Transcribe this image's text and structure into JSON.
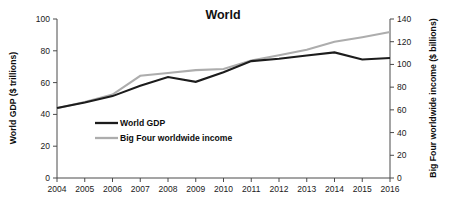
{
  "chart_data": {
    "type": "line",
    "title": "World",
    "xlabel": "",
    "ylabel": "World GDP ($ trillions)",
    "y2label": "Big Four worldwide income ($ billions)",
    "grid": false,
    "legend_position": "inside-left",
    "categories": [
      "2004",
      "2005",
      "2006",
      "2007",
      "2008",
      "2009",
      "2010",
      "2011",
      "2012",
      "2013",
      "2014",
      "2015",
      "2016"
    ],
    "x": [
      2004,
      2005,
      2006,
      2007,
      2008,
      2009,
      2010,
      2011,
      2012,
      2013,
      2014,
      2015,
      2016
    ],
    "ylim": [
      0,
      100
    ],
    "yticks": [
      0,
      20,
      40,
      60,
      80,
      100
    ],
    "ytick_labels": [
      "0",
      "20",
      "40",
      "60",
      "80",
      "100"
    ],
    "y2lim": [
      0,
      140
    ],
    "y2ticks": [
      0,
      20,
      40,
      60,
      80,
      100,
      120,
      140
    ],
    "y2tick_labels": [
      "0",
      "20",
      "40",
      "60",
      "80",
      "100",
      "120",
      "140"
    ],
    "series": [
      {
        "name": "World GDP",
        "axis": "left",
        "color": "#1c1c1c",
        "values": [
          44,
          47.5,
          51.5,
          58,
          63.5,
          60.5,
          66.5,
          73.5,
          75,
          77,
          79,
          74.5,
          75.5
        ]
      },
      {
        "name": "Big Four worldwide income",
        "axis": "right",
        "color": "#adadad",
        "values": [
          61.5,
          67,
          73.5,
          90,
          92.5,
          95,
          96,
          103.5,
          108,
          113,
          120,
          124,
          128.5
        ]
      }
    ]
  },
  "legend": {
    "items": [
      {
        "label": "World GDP",
        "color": "#1c1c1c"
      },
      {
        "label": "Big Four worldwide income",
        "color": "#adadad"
      }
    ]
  }
}
